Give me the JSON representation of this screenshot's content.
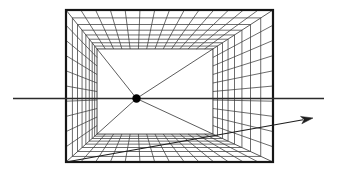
{
  "figure": {
    "kind": "one-point-perspective-grid-box",
    "canvas": {
      "width": 337,
      "height": 173
    },
    "colors": {
      "background": "#ffffff",
      "grid": "#3c3c3c",
      "diagonal": "#4a4a4a",
      "frame": "#161616",
      "back_wall_edge": "#2f2f2f",
      "horizon": "#2b2b2b",
      "arrow": "#1d1d1d",
      "dot": "#000000"
    },
    "outer_rect": {
      "left": 66,
      "top": 10,
      "right": 273,
      "bottom": 162
    },
    "vanishing_point": {
      "x": 136.5,
      "y": 98.5,
      "dot_radius": 4.2
    },
    "grid": {
      "columns": 14,
      "rows": 10,
      "depth_lines": 8,
      "depth_c": 0.0982143
    },
    "horizon_line": {
      "x1": 13,
      "y": 98.5,
      "x2": 324
    },
    "arrow": {
      "x1": 66,
      "y1": 162,
      "x2": 313,
      "y2": 118,
      "head_length": 12,
      "head_width": 7.5
    },
    "stroke": {
      "grid_width": 0.75,
      "diagonal_width": 0.9,
      "frame_width": 2.2,
      "back_wall_width": 0.9,
      "horizon_width": 1.5,
      "arrow_width": 1.1
    }
  }
}
